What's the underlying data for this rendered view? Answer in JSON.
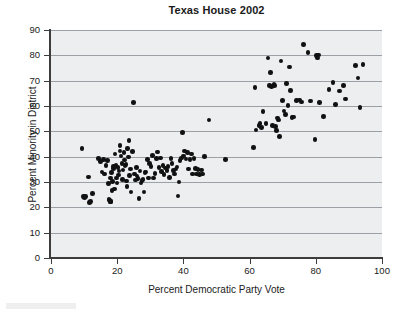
{
  "chart_data": {
    "type": "scatter",
    "title": "Texas House 2002",
    "xlabel": "Percent Democratic Party Vote",
    "ylabel": "Percent Minority in District",
    "xlim": [
      0,
      100
    ],
    "ylim": [
      0,
      90
    ],
    "xticks": [
      0,
      20,
      40,
      60,
      80,
      100
    ],
    "yticks": [
      0,
      10,
      20,
      30,
      40,
      50,
      60,
      70,
      80,
      90
    ],
    "grid": "horizontal",
    "legend": null,
    "marker": {
      "shape": "circle",
      "color": "#111111",
      "size": 4.6
    },
    "plot_background": "#eceef0",
    "series": [
      {
        "name": "Texas House districts",
        "points": [
          [
            9.4,
            43.2
          ],
          [
            9.8,
            24.2
          ],
          [
            10.1,
            23.8
          ],
          [
            10.4,
            24.3
          ],
          [
            11.3,
            32.0
          ],
          [
            11.6,
            21.8
          ],
          [
            11.9,
            22.3
          ],
          [
            12.6,
            25.4
          ],
          [
            14.3,
            39.2
          ],
          [
            14.9,
            38.1
          ],
          [
            15.4,
            34.0
          ],
          [
            15.8,
            38.8
          ],
          [
            16.2,
            33.1
          ],
          [
            16.6,
            36.6
          ],
          [
            17.0,
            38.6
          ],
          [
            17.3,
            29.3
          ],
          [
            17.5,
            23.0
          ],
          [
            17.6,
            22.9
          ],
          [
            17.8,
            22.2
          ],
          [
            17.9,
            31.6
          ],
          [
            18.0,
            22.4
          ],
          [
            18.1,
            22.3
          ],
          [
            18.3,
            33.8
          ],
          [
            18.4,
            26.6
          ],
          [
            18.6,
            30.2
          ],
          [
            18.8,
            36.2
          ],
          [
            18.9,
            35.4
          ],
          [
            19.1,
            27.2
          ],
          [
            19.3,
            41.0
          ],
          [
            19.6,
            36.6
          ],
          [
            19.8,
            31.5
          ],
          [
            20.0,
            29.6
          ],
          [
            20.2,
            35.8
          ],
          [
            20.4,
            32.7
          ],
          [
            20.6,
            34.3
          ],
          [
            20.8,
            44.5
          ],
          [
            20.9,
            42.3
          ],
          [
            21.2,
            40.3
          ],
          [
            21.4,
            37.2
          ],
          [
            21.6,
            31.0
          ],
          [
            21.8,
            34.8
          ],
          [
            22.0,
            41.6
          ],
          [
            22.2,
            38.7
          ],
          [
            22.4,
            36.6
          ],
          [
            22.6,
            36.9
          ],
          [
            22.8,
            30.4
          ],
          [
            23.0,
            28.2
          ],
          [
            23.2,
            43.2
          ],
          [
            23.4,
            39.9
          ],
          [
            23.6,
            46.3
          ],
          [
            23.8,
            32.5
          ],
          [
            24.0,
            35.2
          ],
          [
            24.2,
            26.0
          ],
          [
            24.6,
            42.0
          ],
          [
            24.9,
            61.4
          ],
          [
            25.2,
            33.1
          ],
          [
            25.5,
            30.8
          ],
          [
            25.8,
            35.8
          ],
          [
            26.0,
            32.3
          ],
          [
            26.3,
            31.4
          ],
          [
            26.6,
            23.5
          ],
          [
            26.9,
            34.4
          ],
          [
            27.2,
            29.6
          ],
          [
            27.5,
            30.6
          ],
          [
            27.8,
            31.0
          ],
          [
            28.1,
            26.0
          ],
          [
            28.4,
            33.8
          ],
          [
            28.7,
            34.0
          ],
          [
            29.1,
            38.9
          ],
          [
            29.4,
            31.6
          ],
          [
            29.8,
            37.2
          ],
          [
            30.2,
            36.1
          ],
          [
            30.6,
            40.4
          ],
          [
            31.0,
            31.6
          ],
          [
            31.4,
            33.3
          ],
          [
            31.8,
            39.3
          ],
          [
            32.2,
            41.8
          ],
          [
            32.6,
            35.8
          ],
          [
            33.0,
            39.4
          ],
          [
            33.4,
            34.1
          ],
          [
            33.8,
            36.4
          ],
          [
            34.2,
            32.9
          ],
          [
            34.6,
            35.6
          ],
          [
            35.0,
            34.6
          ],
          [
            35.4,
            36.2
          ],
          [
            35.8,
            31.8
          ],
          [
            36.2,
            39.3
          ],
          [
            36.6,
            37.3
          ],
          [
            37.0,
            34.6
          ],
          [
            37.4,
            33.2
          ],
          [
            37.8,
            35.2
          ],
          [
            38.1,
            35.9
          ],
          [
            38.4,
            24.4
          ],
          [
            38.7,
            30.0
          ],
          [
            39.0,
            38.5
          ],
          [
            39.4,
            39.4
          ],
          [
            39.8,
            49.5
          ],
          [
            40.1,
            40.3
          ],
          [
            40.4,
            42.2
          ],
          [
            40.8,
            39.0
          ],
          [
            41.2,
            41.6
          ],
          [
            41.6,
            35.2
          ],
          [
            42.0,
            38.8
          ],
          [
            42.4,
            41.0
          ],
          [
            42.8,
            33.2
          ],
          [
            43.2,
            39.2
          ],
          [
            43.6,
            35.4
          ],
          [
            44.0,
            33.1
          ],
          [
            44.4,
            35.0
          ],
          [
            44.8,
            33.0
          ],
          [
            45.4,
            34.8
          ],
          [
            45.8,
            33.1
          ],
          [
            46.3,
            40.1
          ],
          [
            47.7,
            54.5
          ],
          [
            52.8,
            38.9
          ],
          [
            61.2,
            43.6
          ],
          [
            61.6,
            67.2
          ],
          [
            61.9,
            50.5
          ],
          [
            62.8,
            52.4
          ],
          [
            63.2,
            53.0
          ],
          [
            63.6,
            51.6
          ],
          [
            64.0,
            57.8
          ],
          [
            65.0,
            53.1
          ],
          [
            65.6,
            78.9
          ],
          [
            66.0,
            68.2
          ],
          [
            66.4,
            73.2
          ],
          [
            66.7,
            67.8
          ],
          [
            67.0,
            52.2
          ],
          [
            67.4,
            68.4
          ],
          [
            67.6,
            68.0
          ],
          [
            67.8,
            51.9
          ],
          [
            68.1,
            50.4
          ],
          [
            68.4,
            55.3
          ],
          [
            68.7,
            54.5
          ],
          [
            69.0,
            47.9
          ],
          [
            69.5,
            77.8
          ],
          [
            69.9,
            62.2
          ],
          [
            70.4,
            58.1
          ],
          [
            70.8,
            56.6
          ],
          [
            71.2,
            68.8
          ],
          [
            71.6,
            60.1
          ],
          [
            72.0,
            75.4
          ],
          [
            72.4,
            66.2
          ],
          [
            72.8,
            55.4
          ],
          [
            73.2,
            55.7
          ],
          [
            74.2,
            62.1
          ],
          [
            75.0,
            62.4
          ],
          [
            75.6,
            61.6
          ],
          [
            76.2,
            84.2
          ],
          [
            77.6,
            81.2
          ],
          [
            78.4,
            61.9
          ],
          [
            79.8,
            46.8
          ],
          [
            80.2,
            79.9
          ],
          [
            80.6,
            79.0
          ],
          [
            80.8,
            80.2
          ],
          [
            81.2,
            61.3
          ],
          [
            82.4,
            55.9
          ],
          [
            84.0,
            66.6
          ],
          [
            85.2,
            69.2
          ],
          [
            86.0,
            60.5
          ],
          [
            87.2,
            65.9
          ],
          [
            88.4,
            68.2
          ],
          [
            89.0,
            62.8
          ],
          [
            92.0,
            76.1
          ],
          [
            92.8,
            71.0
          ],
          [
            93.4,
            59.3
          ],
          [
            94.2,
            76.3
          ]
        ]
      }
    ]
  },
  "axes": {
    "y_tick_labels": [
      "90",
      "80",
      "70",
      "60",
      "50",
      "40",
      "30",
      "20",
      "10",
      "0"
    ],
    "x_tick_labels": [
      "0",
      "20",
      "40",
      "60",
      "80",
      "100"
    ]
  }
}
